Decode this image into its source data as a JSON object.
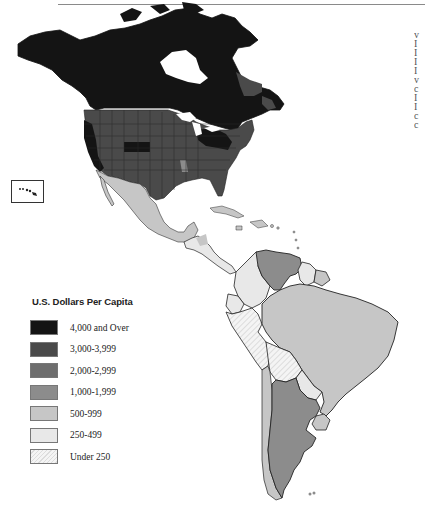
{
  "legend": {
    "title": "U.S. Dollars Per Capita",
    "items": [
      {
        "label": "4,000 and Over",
        "color": "#141414",
        "pattern": "solid"
      },
      {
        "label": "3,000-3,999",
        "color": "#4a4a4a",
        "pattern": "solid"
      },
      {
        "label": "2,000-2,999",
        "color": "#6e6e6e",
        "pattern": "solid"
      },
      {
        "label": "1,000-1,999",
        "color": "#8c8c8c",
        "pattern": "solid"
      },
      {
        "label": "500-999",
        "color": "#c6c6c6",
        "pattern": "solid"
      },
      {
        "label": "250-499",
        "color": "#e8e8e8",
        "pattern": "solid"
      },
      {
        "label": "Under 250",
        "color": "#f4f4f4",
        "pattern": "hatched"
      }
    ]
  },
  "regions": {
    "canada": {
      "name": "Canada",
      "class": "4,000 and Over"
    },
    "usa_main": {
      "name": "United States",
      "class": "3,000-3,999"
    },
    "usa_dark_states": {
      "name": "U.S. high-income states",
      "class": "4,000 and Over"
    },
    "mexico": {
      "name": "Mexico",
      "class": "500-999"
    },
    "central_america": {
      "name": "Central America",
      "class": "250-499"
    },
    "caribbean": {
      "name": "Caribbean",
      "class": "500-999"
    },
    "venezuela": {
      "name": "Venezuela",
      "class": "1,000-1,999"
    },
    "colombia": {
      "name": "Colombia",
      "class": "250-499"
    },
    "ecuador": {
      "name": "Ecuador",
      "class": "250-499"
    },
    "peru": {
      "name": "Peru",
      "class": "Under 250"
    },
    "bolivia": {
      "name": "Bolivia",
      "class": "Under 250"
    },
    "brazil": {
      "name": "Brazil",
      "class": "500-999"
    },
    "paraguay": {
      "name": "Paraguay",
      "class": "250-499"
    },
    "uruguay": {
      "name": "Uruguay",
      "class": "500-999"
    },
    "argentina": {
      "name": "Argentina",
      "class": "1,000-1,999"
    },
    "chile": {
      "name": "Chile",
      "class": "500-999"
    },
    "guianas": {
      "name": "Guyana / Suriname / French Guiana",
      "class": "500-999"
    },
    "hawaii": {
      "name": "Hawaii inset",
      "class": "3,000-3,999"
    }
  },
  "edge_text": [
    "v",
    "I",
    "I",
    "I",
    "I",
    "v",
    "c",
    "I",
    "I",
    "c",
    "c"
  ]
}
